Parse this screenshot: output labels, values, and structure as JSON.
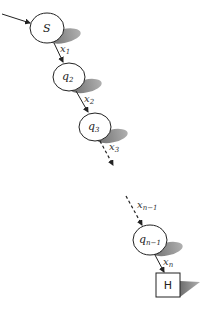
{
  "diagram": {
    "type": "state-chain",
    "nodes": [
      {
        "id": "S",
        "label": "S",
        "sub": "",
        "shape": "circle"
      },
      {
        "id": "q2",
        "label": "q",
        "sub": "2",
        "shape": "circle"
      },
      {
        "id": "q3",
        "label": "q",
        "sub": "3",
        "shape": "circle"
      },
      {
        "id": "qn1",
        "label": "q",
        "sub": "n−1",
        "shape": "circle"
      },
      {
        "id": "H",
        "label": "H",
        "sub": "",
        "shape": "square"
      }
    ],
    "edges": [
      {
        "from": "start",
        "to": "S",
        "label": "",
        "sub": "",
        "style": "solid"
      },
      {
        "from": "S",
        "to": "q2",
        "label": "x",
        "sub": "1",
        "style": "solid"
      },
      {
        "from": "q2",
        "to": "q3",
        "label": "x",
        "sub": "2",
        "style": "solid"
      },
      {
        "from": "q3",
        "to": "...",
        "label": "x",
        "sub": "3",
        "style": "dashed"
      },
      {
        "from": "...",
        "to": "qn1",
        "label": "x",
        "sub": "n−1",
        "style": "dashed"
      },
      {
        "from": "qn1",
        "to": "H",
        "label": "x",
        "sub": "n",
        "style": "solid"
      }
    ],
    "colors": {
      "stroke": "#222222",
      "shadow": "#8a8a8a",
      "fill": "#ffffff"
    }
  }
}
